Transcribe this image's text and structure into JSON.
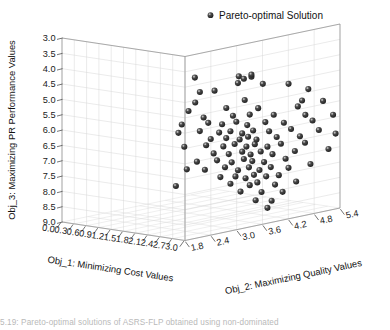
{
  "figure": {
    "type": "scatter3d",
    "background": "#ffffff",
    "caption": "5.19:  Pareto-optimal solutions of ASRS-FLP obtained using non-dominated"
  },
  "legend": {
    "position": "top-center",
    "marker_shape": "sphere",
    "marker_color": "#2b2b2b",
    "label": "Pareto-optimal Solution"
  },
  "chart_data": {
    "type": "scatter",
    "title": "",
    "projection": "3d",
    "grid": true,
    "legend_position": "top-center",
    "series_name": "Pareto-optimal Solution",
    "marker_color": "#2b2b2b",
    "marker_size": 4,
    "xlabel": "Obj_1: Minimizing Cost Values",
    "ylabel": "Obj_2: Maximizing Quality Values",
    "zlabel": "Obj_3: Maximizing PR Performance Values",
    "xlim": [
      0.0,
      3.0
    ],
    "ylim": [
      1.8,
      5.4
    ],
    "zlim": [
      9.0,
      3.0
    ],
    "z_inverted": true,
    "xticks": [
      "0.0",
      "0.3",
      "0.6",
      "0.9",
      "1.2",
      "1.5",
      "1.8",
      "2.1",
      "2.4",
      "2.7",
      "3.0"
    ],
    "yticks": [
      "1.8",
      "2.4",
      "3.0",
      "3.6",
      "4.2",
      "4.8",
      "5.4"
    ],
    "zticks": [
      "3.0",
      "3.5",
      "4.0",
      "4.5",
      "5.0",
      "5.5",
      "6.0",
      "6.5",
      "7.0",
      "7.5",
      "8.0",
      "8.5",
      "9.0"
    ],
    "n_points": 101,
    "points": [
      [
        1.35,
        3.6,
        4.55
      ],
      [
        1.95,
        4.05,
        4.52
      ],
      [
        2.02,
        4.1,
        4.6
      ],
      [
        2.1,
        4.2,
        4.55
      ],
      [
        1.98,
        4.0,
        4.72
      ],
      [
        2.22,
        4.35,
        4.8
      ],
      [
        2.48,
        4.7,
        4.85
      ],
      [
        1.42,
        3.65,
        5.02
      ],
      [
        1.62,
        3.8,
        4.98
      ],
      [
        2.7,
        4.95,
        5.05
      ],
      [
        1.38,
        3.58,
        5.35
      ],
      [
        2.02,
        4.12,
        5.3
      ],
      [
        2.62,
        4.88,
        5.42
      ],
      [
        1.3,
        3.5,
        5.62
      ],
      [
        1.78,
        3.92,
        5.55
      ],
      [
        2.18,
        4.28,
        5.58
      ],
      [
        2.58,
        4.82,
        5.6
      ],
      [
        2.88,
        5.12,
        5.45
      ],
      [
        1.48,
        3.68,
        5.85
      ],
      [
        1.88,
        3.98,
        5.8
      ],
      [
        2.08,
        4.18,
        5.78
      ],
      [
        2.35,
        4.48,
        5.82
      ],
      [
        2.68,
        4.9,
        5.88
      ],
      [
        3.02,
        5.22,
        5.9
      ],
      [
        1.22,
        3.42,
        6.05
      ],
      [
        1.55,
        3.72,
        6.02
      ],
      [
        1.72,
        3.88,
        6.08
      ],
      [
        1.92,
        4.02,
        6.0
      ],
      [
        2.05,
        4.15,
        6.12
      ],
      [
        2.25,
        4.38,
        6.05
      ],
      [
        2.45,
        4.62,
        6.1
      ],
      [
        2.75,
        5.0,
        6.08
      ],
      [
        1.18,
        3.38,
        6.32
      ],
      [
        1.45,
        3.62,
        6.28
      ],
      [
        1.68,
        3.85,
        6.35
      ],
      [
        1.85,
        3.95,
        6.3
      ],
      [
        2.0,
        4.08,
        6.38
      ],
      [
        2.12,
        4.22,
        6.3
      ],
      [
        2.3,
        4.42,
        6.35
      ],
      [
        2.52,
        4.72,
        6.32
      ],
      [
        2.82,
        5.08,
        6.4
      ],
      [
        1.58,
        3.75,
        6.55
      ],
      [
        1.8,
        3.9,
        6.52
      ],
      [
        1.96,
        4.06,
        6.58
      ],
      [
        2.06,
        4.16,
        6.5
      ],
      [
        2.16,
        4.26,
        6.6
      ],
      [
        2.38,
        4.52,
        6.55
      ],
      [
        2.6,
        4.85,
        6.58
      ],
      [
        3.05,
        5.25,
        6.52
      ],
      [
        1.25,
        3.45,
        6.78
      ],
      [
        1.52,
        3.7,
        6.75
      ],
      [
        1.74,
        3.89,
        6.8
      ],
      [
        1.9,
        4.0,
        6.72
      ],
      [
        2.04,
        4.14,
        6.82
      ],
      [
        2.14,
        4.24,
        6.75
      ],
      [
        2.28,
        4.4,
        6.85
      ],
      [
        2.42,
        4.58,
        6.78
      ],
      [
        2.65,
        4.92,
        6.8
      ],
      [
        1.62,
        3.78,
        7.02
      ],
      [
        1.82,
        3.94,
        7.05
      ],
      [
        1.99,
        4.09,
        6.98
      ],
      [
        2.09,
        4.19,
        7.08
      ],
      [
        2.2,
        4.32,
        7.0
      ],
      [
        2.34,
        4.46,
        7.1
      ],
      [
        2.55,
        4.78,
        7.05
      ],
      [
        2.95,
        5.18,
        7.02
      ],
      [
        1.4,
        3.6,
        7.28
      ],
      [
        1.66,
        3.82,
        7.25
      ],
      [
        1.86,
        3.97,
        7.32
      ],
      [
        2.01,
        4.11,
        7.22
      ],
      [
        2.11,
        4.21,
        7.3
      ],
      [
        2.24,
        4.36,
        7.35
      ],
      [
        2.46,
        4.65,
        7.28
      ],
      [
        1.28,
        3.48,
        7.52
      ],
      [
        1.5,
        3.69,
        7.55
      ],
      [
        1.76,
        3.91,
        7.48
      ],
      [
        1.94,
        4.04,
        7.58
      ],
      [
        2.07,
        4.17,
        7.5
      ],
      [
        2.19,
        4.3,
        7.6
      ],
      [
        2.32,
        4.44,
        7.52
      ],
      [
        2.5,
        4.68,
        7.58
      ],
      [
        2.72,
        4.98,
        7.5
      ],
      [
        1.7,
        3.86,
        7.8
      ],
      [
        1.91,
        4.01,
        7.78
      ],
      [
        2.03,
        4.13,
        7.85
      ],
      [
        2.13,
        4.23,
        7.75
      ],
      [
        2.26,
        4.39,
        7.82
      ],
      [
        2.4,
        4.55,
        7.8
      ],
      [
        1.15,
        3.35,
        8.05
      ],
      [
        1.84,
        3.96,
        8.02
      ],
      [
        2.08,
        4.18,
        8.08
      ],
      [
        2.17,
        4.27,
        8.0
      ],
      [
        2.36,
        4.5,
        8.1
      ],
      [
        2.56,
        4.8,
        8.05
      ],
      [
        1.97,
        4.07,
        8.28
      ],
      [
        2.21,
        4.33,
        8.32
      ],
      [
        2.44,
        4.6,
        8.35
      ],
      [
        2.15,
        4.25,
        8.58
      ],
      [
        2.33,
        4.45,
        8.62
      ],
      [
        2.27,
        4.41,
        8.85
      ],
      [
        2.1,
        4.2,
        4.48
      ]
    ]
  },
  "axes": {
    "z": {
      "title": "Obj_3: Maximizing PR Performance Values",
      "ticks": [
        "3.0",
        "3.5",
        "4.0",
        "4.5",
        "5.0",
        "5.5",
        "6.0",
        "6.5",
        "7.0",
        "7.5",
        "8.0",
        "8.5",
        "9.0"
      ]
    },
    "x": {
      "title": "Obj_1: Minimizing Cost Values",
      "ticks": [
        "0.0",
        "0.3",
        "0.6",
        "0.9",
        "1.2",
        "1.5",
        "1.8",
        "2.1",
        "2.4",
        "2.7",
        "3.0"
      ]
    },
    "y": {
      "title": "Obj_2: Maximizing Quality Values",
      "ticks": [
        "1.8",
        "2.4",
        "3.0",
        "3.6",
        "4.2",
        "4.8",
        "5.4"
      ]
    }
  }
}
